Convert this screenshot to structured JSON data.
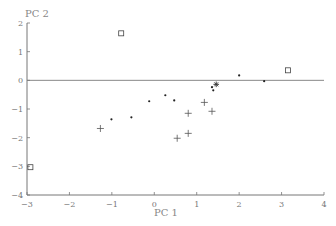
{
  "chart_data": {
    "type": "scatter",
    "title": "",
    "xlabel": "PC 1",
    "ylabel": "PC 2",
    "xlim": [
      -3,
      4
    ],
    "ylim": [
      -4,
      2
    ],
    "x_ticks": [
      "-3",
      "-2",
      "-1",
      "0",
      "1",
      "2",
      "3",
      "4"
    ],
    "y_ticks": [
      "2",
      "1",
      "0",
      "-1",
      "-2",
      "-3",
      "-4"
    ],
    "grid": false,
    "reference_line": {
      "y": 0
    },
    "legend": null,
    "series": [
      {
        "name": "squares",
        "marker": "square",
        "points": [
          {
            "x": -0.78,
            "y": 1.64
          },
          {
            "x": 3.15,
            "y": 0.35
          },
          {
            "x": -2.92,
            "y": -3.03
          }
        ]
      },
      {
        "name": "dots",
        "marker": "dot",
        "points": [
          {
            "x": 2.0,
            "y": 0.17
          },
          {
            "x": 2.59,
            "y": -0.03
          },
          {
            "x": 1.36,
            "y": -0.24
          },
          {
            "x": 1.39,
            "y": -0.35
          },
          {
            "x": -1.01,
            "y": -1.36
          },
          {
            "x": -0.54,
            "y": -1.29
          },
          {
            "x": -0.12,
            "y": -0.73
          },
          {
            "x": 0.26,
            "y": -0.52
          },
          {
            "x": 0.47,
            "y": -0.7
          }
        ]
      },
      {
        "name": "star",
        "marker": "star",
        "points": [
          {
            "x": 1.46,
            "y": -0.14
          }
        ]
      },
      {
        "name": "crosses",
        "marker": "plus",
        "points": [
          {
            "x": 1.18,
            "y": -0.77
          },
          {
            "x": 1.36,
            "y": -1.08
          },
          {
            "x": -1.27,
            "y": -1.68
          },
          {
            "x": 0.8,
            "y": -1.15
          },
          {
            "x": 0.8,
            "y": -1.85
          },
          {
            "x": 0.54,
            "y": -2.02
          }
        ]
      }
    ]
  }
}
